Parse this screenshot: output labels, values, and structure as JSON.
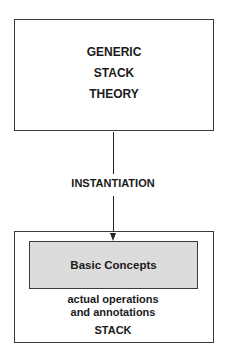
{
  "diagram": {
    "theory_box": {
      "lines": [
        "GENERIC",
        "STACK",
        "THEORY"
      ]
    },
    "edge": {
      "label": "INSTANTIATION",
      "from": "theory_box",
      "to": "stack_box"
    },
    "stack_box": {
      "inner_box": {
        "label": "Basic Concepts",
        "fill_color": "#dcdcdc"
      },
      "annotation_lines": [
        "actual operations",
        "and annotations"
      ],
      "label": "STACK"
    }
  }
}
